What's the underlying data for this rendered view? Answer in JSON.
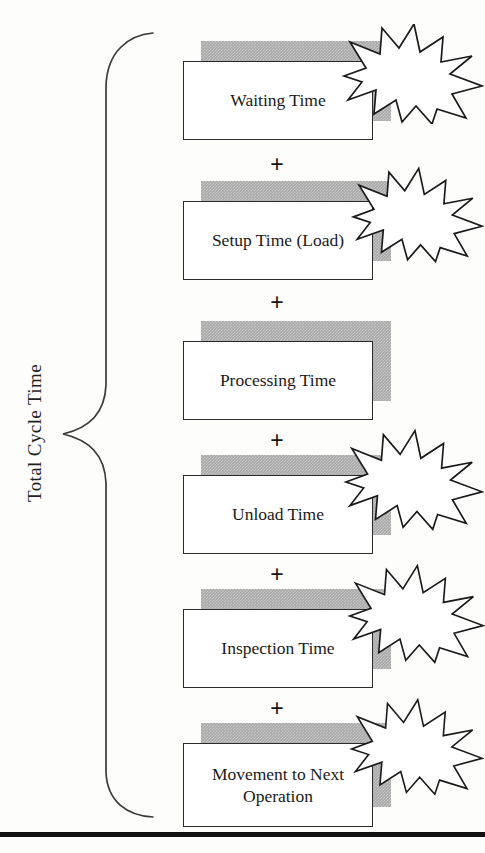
{
  "diagram": {
    "title": "Total Cycle Time",
    "bracket_label": "Total Cycle Time",
    "operator": "+",
    "colors": {
      "box_fill": "#ffffff",
      "box_border": "#2a2a2a",
      "shadow_gray": "#a9a9a9",
      "burst_fill": "#ffffff",
      "burst_stroke": "#1a1a1a",
      "text": "#1a1a1a",
      "rule": "#111111"
    },
    "components": [
      {
        "label": "Waiting Time",
        "has_burst": true,
        "lines": 1
      },
      {
        "label": "Setup Time (Load)",
        "has_burst": true,
        "lines": 1
      },
      {
        "label": "Processing Time",
        "has_burst": false,
        "lines": 1
      },
      {
        "label": "Unload Time",
        "has_burst": true,
        "lines": 1
      },
      {
        "label": "Inspection Time",
        "has_burst": true,
        "lines": 1
      },
      {
        "label": "Movement to Next Operation",
        "has_burst": true,
        "lines": 2
      }
    ],
    "operators": [
      "+",
      "+",
      "+",
      "+",
      "+"
    ]
  }
}
